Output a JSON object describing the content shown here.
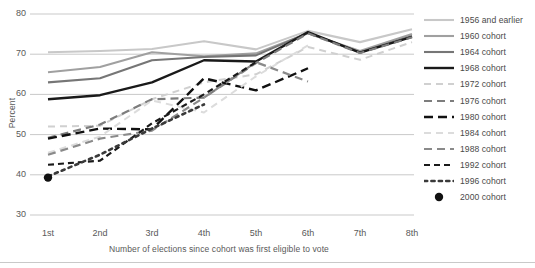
{
  "chart_data": {
    "type": "line",
    "title": "",
    "xlabel": "Number of elections since cohort was first eligible to vote",
    "ylabel": "Percent",
    "categories": [
      "1st",
      "2nd",
      "3rd",
      "4th",
      "5th",
      "6th",
      "7th",
      "8th"
    ],
    "ylim": [
      30,
      80
    ],
    "yticks": [
      30,
      40,
      50,
      60,
      70,
      80
    ],
    "grid": "horizontal",
    "legend_position": "right",
    "series": [
      {
        "name": "1956 and earlier",
        "color": "#c8c8c8",
        "style": "solid",
        "width": 2.1,
        "values": [
          70.5,
          70.8,
          71.3,
          73.2,
          71.2,
          75.8,
          73.0,
          76.2
        ]
      },
      {
        "name": "1960 cohort",
        "color": "#a0a0a0",
        "style": "solid",
        "width": 2.1,
        "values": [
          65.5,
          66.8,
          70.5,
          69.5,
          70.2,
          75.2,
          70.8,
          75.0
        ]
      },
      {
        "name": "1964 cohort",
        "color": "#767676",
        "style": "solid",
        "width": 2.1,
        "values": [
          63.0,
          64.0,
          68.5,
          69.3,
          69.7,
          75.3,
          70.5,
          74.5
        ]
      },
      {
        "name": "1968 cohort",
        "color": "#1a1a1a",
        "style": "solid",
        "width": 2.4,
        "values": [
          58.8,
          59.8,
          63.0,
          68.5,
          68.2,
          75.5,
          70.4,
          74.3
        ]
      },
      {
        "name": "1972 cohort",
        "color": "#d0d0d0",
        "style": "dash-fine",
        "width": 2.0,
        "values": [
          52.0,
          52.2,
          58.8,
          63.0,
          65.0,
          71.8,
          68.6,
          73.0
        ]
      },
      {
        "name": "1976 cohort",
        "color": "#7d7d7d",
        "style": "dash-med",
        "width": 2.2,
        "values": [
          49.2,
          52.5,
          58.8,
          59.2,
          67.8,
          75.2,
          70.3,
          74.2
        ]
      },
      {
        "name": "1980 cohort",
        "color": "#111111",
        "style": "dash-bold",
        "width": 2.4,
        "values": [
          49.0,
          51.5,
          51.3,
          64.0,
          61.0,
          66.5,
          null,
          null
        ]
      },
      {
        "name": "1984 cohort",
        "color": "#dcdcdc",
        "style": "dash-fine",
        "width": 2.0,
        "values": [
          45.5,
          49.5,
          58.5,
          55.5,
          64.5,
          72.2,
          null,
          null
        ]
      },
      {
        "name": "1988 cohort",
        "color": "#8a8a8a",
        "style": "dash-med",
        "width": 2.2,
        "values": [
          45.0,
          49.0,
          51.0,
          59.2,
          68.0,
          63.2,
          null,
          null
        ]
      },
      {
        "name": "1992 cohort",
        "color": "#1a1a1a",
        "style": "dash-sm",
        "width": 2.2,
        "values": [
          42.5,
          43.5,
          52.8,
          60.0,
          68.0,
          null,
          null,
          null
        ]
      },
      {
        "name": "1996 cohort",
        "color": "#3a3a3a",
        "style": "dot",
        "width": 2.6,
        "values": [
          39.6,
          45.0,
          51.5,
          57.5,
          null,
          null,
          null,
          null
        ]
      },
      {
        "name": "2000 cohort",
        "color": "#111111",
        "style": "marker",
        "width": 0,
        "values": [
          39.3,
          null,
          null,
          null,
          null,
          null,
          null,
          null
        ]
      }
    ]
  },
  "legend": {
    "items": [
      "1956 and earlier",
      "1960 cohort",
      "1964 cohort",
      "1968 cohort",
      "1972 cohort",
      "1976 cohort",
      "1980 cohort",
      "1984 cohort",
      "1988 cohort",
      "1992 cohort",
      "1996 cohort",
      "2000 cohort"
    ]
  },
  "axes": {
    "y_title": "Percent",
    "x_title": "Number of elections since cohort was first eligible to vote",
    "y_tick_labels": [
      "80",
      "70",
      "60",
      "50",
      "40",
      "30"
    ],
    "x_tick_labels": [
      "1st",
      "2nd",
      "3rd",
      "4th",
      "5th",
      "6th",
      "7th",
      "8th"
    ]
  }
}
